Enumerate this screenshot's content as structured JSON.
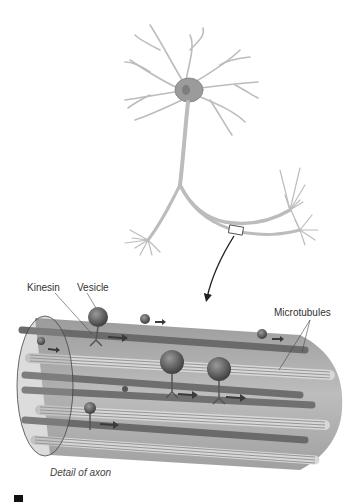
{
  "figure": {
    "labels": {
      "kinesin": "Kinesin",
      "vesicle": "Vesicle",
      "microtubules": "Microtubules",
      "detail_caption": "Detail of axon"
    },
    "colors": {
      "neuron": "#bdbdbd",
      "cell_body": "#8f8f8f",
      "axon_cylinder": "#a9a9a9",
      "microtubule": "#6f6f6f",
      "arrow": "#3a3a3a",
      "vesicle": "#5a5a5a"
    }
  }
}
